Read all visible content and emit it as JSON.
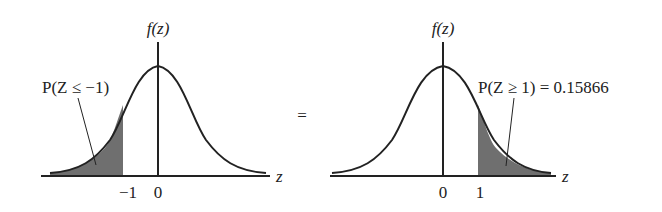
{
  "left_panel": {
    "y_axis_label": "f(z)",
    "x_axis_label": "z",
    "ticks": [
      "−1",
      "0"
    ],
    "annotation": "P(Z ≤ −1)",
    "shaded_region": "z ≤ −1"
  },
  "equals_sign": "=",
  "right_panel": {
    "y_axis_label": "f(z)",
    "x_axis_label": "z",
    "ticks": [
      "0",
      "1"
    ],
    "annotation": "P(Z ≥ 1) = 0.15866",
    "shaded_region": "z ≥ 1"
  },
  "colors": {
    "curve": "#222222",
    "shade": "#6f6f6f"
  }
}
